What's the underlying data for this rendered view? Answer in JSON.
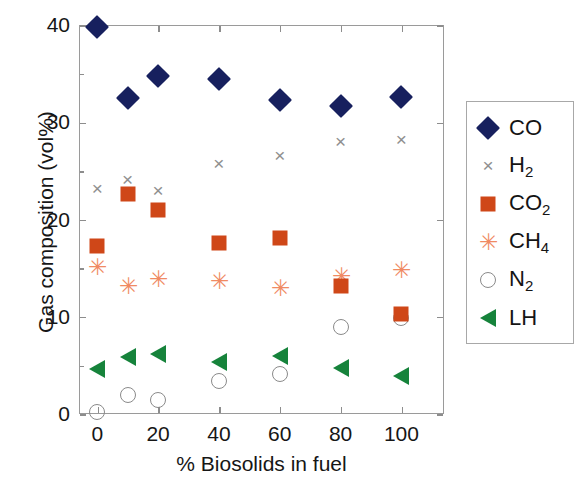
{
  "chart_data": {
    "type": "scatter",
    "title": "",
    "xlabel": "% Biosolids in fuel",
    "ylabel": "Gas composition (vol%)",
    "xlim": [
      -6,
      114
    ],
    "ylim": [
      0,
      40
    ],
    "xticks": [
      0,
      20,
      40,
      60,
      80,
      100
    ],
    "yticks": [
      0,
      10,
      20,
      30,
      40
    ],
    "xticklabels": [
      "0",
      "20",
      "40",
      "60",
      "80",
      "100"
    ],
    "yticklabels": [
      "0",
      "10",
      "20",
      "30",
      "40"
    ],
    "grid": false,
    "legend_position": "outside right",
    "x": [
      0,
      10,
      20,
      40,
      60,
      80,
      100
    ],
    "series": [
      {
        "name": "CO",
        "label": "CO",
        "marker": "filled-diamond",
        "color": "#17205e",
        "values": [
          39.8,
          32.5,
          34.8,
          34.4,
          32.3,
          31.7,
          32.6
        ]
      },
      {
        "name": "H2",
        "label": "H",
        "label_sub": "2",
        "marker": "cross-x",
        "color": "#8f8f8f",
        "values": [
          23.1,
          24.1,
          22.9,
          25.7,
          26.5,
          28.0,
          28.2
        ]
      },
      {
        "name": "CO2",
        "label": "CO",
        "label_sub": "2",
        "marker": "filled-square",
        "color": "#cf4718",
        "values": [
          17.3,
          22.6,
          21.0,
          17.6,
          18.1,
          13.2,
          10.3
        ]
      },
      {
        "name": "CH4",
        "label": "CH",
        "label_sub": "4",
        "marker": "asterisk",
        "color": "#f08a63",
        "values": [
          15.1,
          13.2,
          13.9,
          13.7,
          13.0,
          14.2,
          14.8
        ]
      },
      {
        "name": "N2",
        "label": "N",
        "label_sub": "2",
        "marker": "open-circle",
        "color": "#8a8a8a",
        "values": [
          0.2,
          2.0,
          1.4,
          3.4,
          4.1,
          8.9,
          9.9
        ]
      },
      {
        "name": "LH",
        "label": "LH",
        "marker": "filled-left-triangle",
        "color": "#16833b",
        "values": [
          4.6,
          5.9,
          6.2,
          5.3,
          6.0,
          4.7,
          3.9
        ]
      }
    ]
  }
}
